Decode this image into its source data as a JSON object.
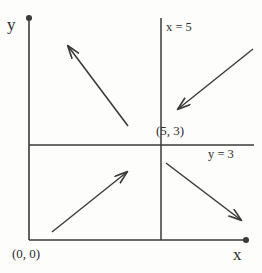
{
  "figure": {
    "type": "diagram",
    "background_color": "#fdfdfb",
    "stroke_color": "#3a3a3a",
    "text_color": "#2e2e2e"
  },
  "axes": {
    "y_axis_label": "y",
    "x_axis_label": "x",
    "origin_label": "(0, 0)",
    "y_axis": {
      "x": 29,
      "y_top": 17,
      "y_bottom": 240,
      "arrow": "up"
    },
    "x_axis": {
      "y": 240,
      "x_left": 29,
      "x_right": 247,
      "arrow": "right"
    }
  },
  "lines": [
    {
      "name": "vertical-line-x5",
      "label": "x = 5",
      "orientation": "vertical",
      "x": 161,
      "y_start": 18,
      "y_end": 240
    },
    {
      "name": "horizontal-line-y3",
      "label": "y = 3",
      "orientation": "horizontal",
      "y": 145,
      "x_start": 29,
      "x_end": 254
    }
  ],
  "intersection": {
    "label": "(5, 3)",
    "x": 161,
    "y": 145
  },
  "arrows": [
    {
      "name": "arrow-upper-left-quadrant",
      "region": "upper-left",
      "direction": "up-left",
      "from": {
        "x": 128,
        "y": 126
      },
      "to": {
        "x": 66,
        "y": 44
      }
    },
    {
      "name": "arrow-upper-right-quadrant",
      "region": "upper-right",
      "direction": "down-left",
      "from": {
        "x": 253,
        "y": 49
      },
      "to": {
        "x": 176,
        "y": 110
      }
    },
    {
      "name": "arrow-lower-left-quadrant",
      "region": "lower-left",
      "direction": "up-right",
      "from": {
        "x": 52,
        "y": 232
      },
      "to": {
        "x": 129,
        "y": 170
      }
    },
    {
      "name": "arrow-lower-right-quadrant",
      "region": "lower-right",
      "direction": "down-right",
      "from": {
        "x": 166,
        "y": 163
      },
      "to": {
        "x": 243,
        "y": 222
      }
    }
  ]
}
